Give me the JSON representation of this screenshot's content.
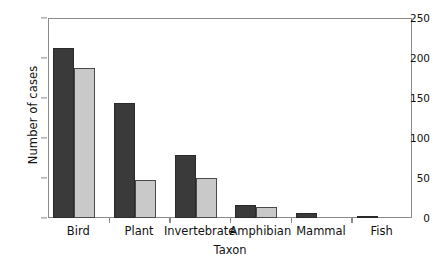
{
  "chart_data": {
    "type": "bar",
    "title": "",
    "xlabel": "Taxon",
    "ylabel": "Number of cases",
    "categories": [
      "Bird",
      "Plant",
      "Invertebrate",
      "Amphibian",
      "Mammal",
      "Fish"
    ],
    "series": [
      {
        "name": "series-1-dark",
        "color": "#3a3a3a",
        "values": [
          212,
          144,
          79,
          16,
          6,
          3
        ]
      },
      {
        "name": "series-2-light",
        "color": "#c9c9c9",
        "values": [
          188,
          48,
          50,
          14,
          0,
          0
        ]
      }
    ],
    "ylim": [
      0,
      250
    ],
    "yticks": [
      0,
      50,
      100,
      150,
      200,
      250
    ],
    "ytick_labels": [
      "0",
      "50",
      "100",
      "150",
      "200",
      "250"
    ],
    "grid": false,
    "legend": "none",
    "frame_color": "#8a8a8a"
  }
}
